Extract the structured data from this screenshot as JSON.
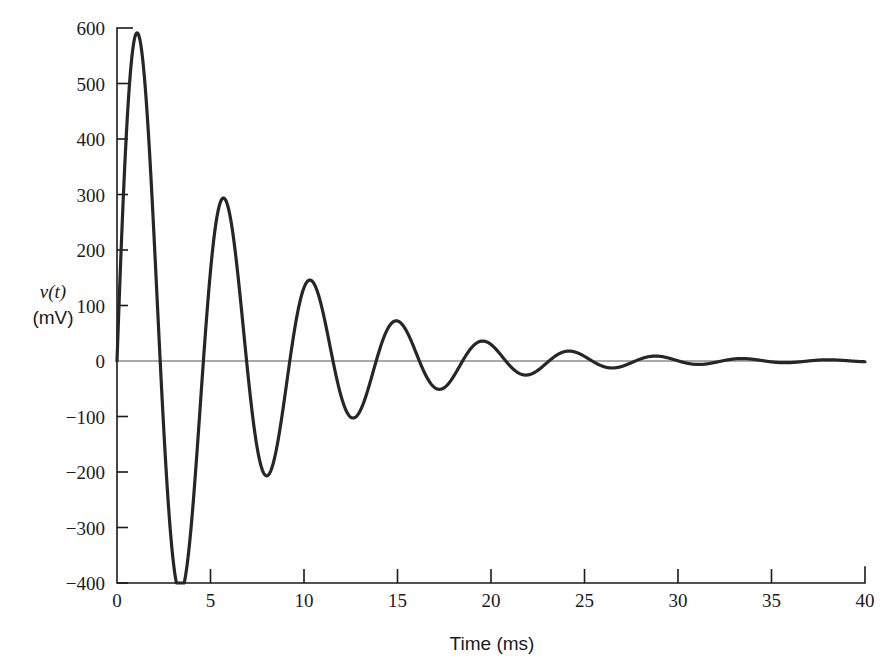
{
  "chart_data": {
    "type": "line",
    "title": "",
    "subtitle": "",
    "xlabel": "Time (ms)",
    "ylabel_line1": "v(t)",
    "ylabel_line2": "(mV)",
    "ylabel_full": "v(t) (mV)",
    "xlim": [
      0,
      40
    ],
    "ylim": [
      -400,
      600
    ],
    "xticks": [
      0,
      5,
      10,
      15,
      20,
      25,
      30,
      35,
      40
    ],
    "xtick_labels": [
      "0",
      "5",
      "10",
      "15",
      "20",
      "25",
      "30",
      "35",
      "40"
    ],
    "yticks": [
      -400,
      -300,
      -200,
      -100,
      0,
      100,
      200,
      300,
      400,
      500,
      600
    ],
    "ytick_labels": [
      "-400",
      "-300",
      "-200",
      "-100",
      "0",
      "100",
      "200",
      "300",
      "400",
      "500",
      "600"
    ],
    "grid": false,
    "legend": null,
    "annotations": [],
    "line_color": "#262626",
    "line_width": 3.2,
    "axis_color": "#1a1a1a",
    "zero_line_color": "#4d4d4d",
    "series": [
      {
        "name": "v(t)",
        "description": "Underdamped second-order step response: decaying sinusoid",
        "model": "v(t) = A * exp(-t/tau) * sin(2*pi*t/T)",
        "amplitude_A": 700,
        "tau_ms": 6.6,
        "period_ms": 4.62,
        "x": [
          0,
          1.3,
          2.9,
          5.3,
          7.4,
          9.6,
          11.8,
          14.0,
          16.2,
          18.4,
          20.6,
          22.9,
          25.1,
          27.4,
          29.6,
          31.9,
          34.1,
          36.4,
          38.6,
          40
        ],
        "y": [
          0,
          510,
          -375,
          268,
          -195,
          152,
          -105,
          76,
          -57,
          41,
          -29,
          22,
          -15,
          11,
          -8,
          6,
          -4,
          3,
          -2,
          0
        ],
        "extrema": [
          {
            "label": "peak 1",
            "t_ms": 1.3,
            "v_mV": 510
          },
          {
            "label": "trough 1",
            "t_ms": 2.9,
            "v_mV": -375
          },
          {
            "label": "peak 2",
            "t_ms": 5.3,
            "v_mV": 268
          },
          {
            "label": "trough 2",
            "t_ms": 7.4,
            "v_mV": -195
          },
          {
            "label": "peak 3",
            "t_ms": 9.6,
            "v_mV": 152
          },
          {
            "label": "trough 3",
            "t_ms": 11.8,
            "v_mV": -105
          },
          {
            "label": "peak 4",
            "t_ms": 14.0,
            "v_mV": 76
          },
          {
            "label": "trough 4",
            "t_ms": 16.2,
            "v_mV": -57
          },
          {
            "label": "peak 5",
            "t_ms": 18.4,
            "v_mV": 41
          },
          {
            "label": "trough 5",
            "t_ms": 20.6,
            "v_mV": -29
          },
          {
            "label": "peak 6",
            "t_ms": 22.9,
            "v_mV": 22
          },
          {
            "label": "trough 6",
            "t_ms": 25.1,
            "v_mV": -15
          },
          {
            "label": "peak 7",
            "t_ms": 27.4,
            "v_mV": 11
          },
          {
            "label": "trough 7",
            "t_ms": 29.6,
            "v_mV": -8
          },
          {
            "label": "peak 8",
            "t_ms": 31.9,
            "v_mV": 6
          },
          {
            "label": "trough 8",
            "t_ms": 34.1,
            "v_mV": -4
          },
          {
            "label": "peak 9",
            "t_ms": 36.4,
            "v_mV": 3
          },
          {
            "label": "trough 9",
            "t_ms": 38.6,
            "v_mV": -2
          }
        ]
      }
    ]
  }
}
